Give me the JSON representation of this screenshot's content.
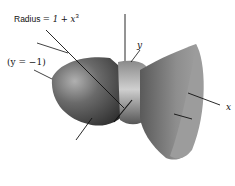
{
  "diagram": {
    "type": "solid-of-revolution",
    "labels": {
      "radius_prefix": "Radius",
      "radius_formula": "= 1 + x",
      "radius_exponent": "3",
      "axis_line_label": "(y = −1)",
      "y_axis": "y",
      "x_axis": "x"
    },
    "colors": {
      "background": "#ffffff",
      "surface_dark": "#3e3e3e",
      "surface_mid": "#6e6e6e",
      "surface_light": "#9a9a9a",
      "highlight": "#c8c8c8",
      "lines": "#111111"
    }
  }
}
